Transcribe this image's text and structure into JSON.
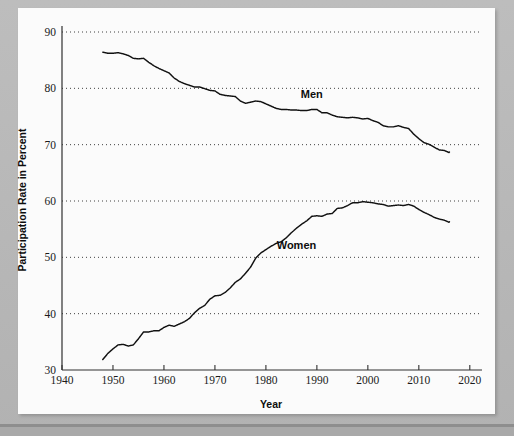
{
  "figure": {
    "background_color": "#b4b4b4",
    "paper_color": "#fbfbfb",
    "line_color": "#111111"
  },
  "chart_data": {
    "type": "line",
    "title": "",
    "subtitle": "",
    "xlabel": "Year",
    "ylabel": "Participation Rate in Percent",
    "xlim": [
      1940,
      2022
    ],
    "ylim": [
      30,
      90
    ],
    "xticks": [
      1940,
      1950,
      1960,
      1970,
      1980,
      1990,
      2000,
      2010,
      2020
    ],
    "xtick_labels": [
      "1940",
      "1950",
      "1960",
      "1970",
      "1980",
      "1990",
      "2000",
      "2010",
      "2020"
    ],
    "yticks": [
      30,
      40,
      50,
      60,
      70,
      80,
      90
    ],
    "ytick_labels": [
      "30",
      "40",
      "50",
      "60",
      "70",
      "80",
      "90"
    ],
    "grid": "horizontal-dotted",
    "legend_position": "inline-annotations",
    "annotations": [
      {
        "text": "Men",
        "x": 1989,
        "y": 78.3
      },
      {
        "text": "Women",
        "x": 1986,
        "y": 51.5
      }
    ],
    "series": [
      {
        "name": "Men",
        "x": [
          1948,
          1949,
          1950,
          1951,
          1952,
          1953,
          1954,
          1955,
          1956,
          1957,
          1958,
          1959,
          1960,
          1961,
          1962,
          1963,
          1964,
          1965,
          1966,
          1967,
          1968,
          1969,
          1970,
          1971,
          1972,
          1973,
          1974,
          1975,
          1976,
          1977,
          1978,
          1979,
          1980,
          1981,
          1982,
          1983,
          1984,
          1985,
          1986,
          1987,
          1988,
          1989,
          1990,
          1991,
          1992,
          1993,
          1994,
          1995,
          1996,
          1997,
          1998,
          1999,
          2000,
          2001,
          2002,
          2003,
          2004,
          2005,
          2006,
          2007,
          2008,
          2009,
          2010,
          2011,
          2012,
          2013,
          2014,
          2015,
          2016
        ],
        "values": [
          86.6,
          86.4,
          86.4,
          86.5,
          86.3,
          86.0,
          85.5,
          85.4,
          85.5,
          84.8,
          84.2,
          83.7,
          83.3,
          82.9,
          82.0,
          81.4,
          81.0,
          80.7,
          80.4,
          80.4,
          80.1,
          79.8,
          79.7,
          79.1,
          78.9,
          78.8,
          78.7,
          77.9,
          77.5,
          77.7,
          77.9,
          77.8,
          77.4,
          77.0,
          76.6,
          76.4,
          76.4,
          76.3,
          76.3,
          76.2,
          76.2,
          76.4,
          76.4,
          75.8,
          75.8,
          75.4,
          75.1,
          75.0,
          74.9,
          75.0,
          74.9,
          74.7,
          74.8,
          74.4,
          74.1,
          73.5,
          73.3,
          73.3,
          73.5,
          73.2,
          73.0,
          72.0,
          71.2,
          70.5,
          70.2,
          69.7,
          69.2,
          69.1,
          68.7
        ]
      },
      {
        "name": "Women",
        "x": [
          1948,
          1949,
          1950,
          1951,
          1952,
          1953,
          1954,
          1955,
          1956,
          1957,
          1958,
          1959,
          1960,
          1961,
          1962,
          1963,
          1964,
          1965,
          1966,
          1967,
          1968,
          1969,
          1970,
          1971,
          1972,
          1973,
          1974,
          1975,
          1976,
          1977,
          1978,
          1979,
          1980,
          1981,
          1982,
          1983,
          1984,
          1985,
          1986,
          1987,
          1988,
          1989,
          1990,
          1991,
          1992,
          1993,
          1994,
          1995,
          1996,
          1997,
          1998,
          1999,
          2000,
          2001,
          2002,
          2003,
          2004,
          2005,
          2006,
          2007,
          2008,
          2009,
          2010,
          2011,
          2012,
          2013,
          2014,
          2015,
          2016
        ],
        "values": [
          32.0,
          33.1,
          33.9,
          34.6,
          34.7,
          34.4,
          34.6,
          35.7,
          36.9,
          36.9,
          37.1,
          37.1,
          37.7,
          38.1,
          37.9,
          38.3,
          38.7,
          39.3,
          40.3,
          41.1,
          41.6,
          42.7,
          43.3,
          43.4,
          43.9,
          44.7,
          45.7,
          46.3,
          47.3,
          48.4,
          50.0,
          50.9,
          51.5,
          52.1,
          52.6,
          52.9,
          53.6,
          54.5,
          55.3,
          56.0,
          56.6,
          57.4,
          57.5,
          57.4,
          57.8,
          57.9,
          58.8,
          58.9,
          59.3,
          59.8,
          59.8,
          60.0,
          59.9,
          59.8,
          59.6,
          59.5,
          59.2,
          59.3,
          59.4,
          59.3,
          59.5,
          59.2,
          58.6,
          58.1,
          57.7,
          57.2,
          56.9,
          56.7,
          56.3
        ]
      }
    ]
  },
  "labels": {
    "xaxis_title": "Year",
    "yaxis_title": "Participation Rate in Percent",
    "men": "Men",
    "women": "Women"
  }
}
